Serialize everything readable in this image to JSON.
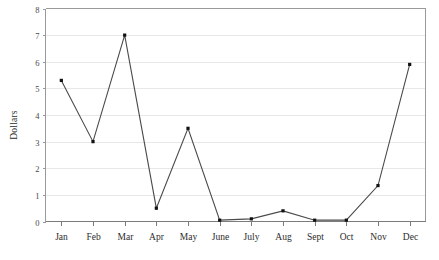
{
  "chart_data": {
    "type": "line",
    "title": "",
    "xlabel": "",
    "ylabel": "Dollars",
    "categories": [
      "Jan",
      "Feb",
      "Mar",
      "Apr",
      "May",
      "June",
      "July",
      "Aug",
      "Sept",
      "Oct",
      "Nov",
      "Dec"
    ],
    "values": [
      5.3,
      3.0,
      7.0,
      0.5,
      3.5,
      0.05,
      0.1,
      0.4,
      0.05,
      0.05,
      1.35,
      5.9
    ],
    "series": [
      {
        "name": "Dollars",
        "values": [
          5.3,
          3.0,
          7.0,
          0.5,
          3.5,
          0.05,
          0.1,
          0.4,
          0.05,
          0.05,
          1.35,
          5.9
        ]
      }
    ],
    "ylim": [
      0,
      8
    ],
    "yticks": [
      0,
      1,
      2,
      3,
      4,
      5,
      6,
      7,
      8
    ],
    "ytick_labels": [
      "0",
      "1",
      "2",
      "3",
      "4",
      "5",
      "6",
      "7",
      "8"
    ],
    "grid": true,
    "grid_axis": "y",
    "legend": false,
    "legend_position": "none",
    "marker": "filled-square",
    "line_color": "#4a4a4a",
    "marker_color": "#111111",
    "grid_color": "#e8e8e8",
    "frame_color": "#9a9a9a",
    "background": "#ffffff"
  }
}
